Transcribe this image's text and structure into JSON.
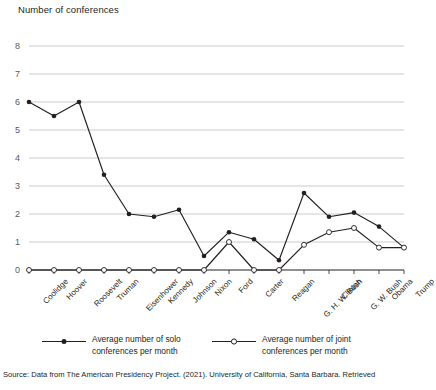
{
  "chart": {
    "axis_title": "Number of conferences",
    "source_note": "Source: Data from The American Presidency Project. (2021). University of California, Santa Barbara. Retrieved"
  },
  "legend": {
    "items": [
      {
        "name": "solo",
        "label": "Average number of solo conferences per month",
        "line1": "Average number of solo",
        "line2": "conferences per month",
        "marker": "filled",
        "color": "#231f20"
      },
      {
        "name": "joint",
        "label": "Average number of joint conferences per month",
        "line1": "Average number of joint",
        "line2": "conferences per month",
        "marker": "open",
        "color": "#231f20"
      }
    ]
  },
  "chart_data": {
    "type": "line",
    "title": "",
    "xlabel": "",
    "ylabel": "Number of conferences",
    "ylim": [
      0,
      8
    ],
    "yticks": [
      0,
      1,
      2,
      3,
      4,
      5,
      6,
      7,
      8
    ],
    "grid": true,
    "legend_position": "bottom",
    "categories": [
      "Coolidge",
      "Hoover",
      "Roosevelt",
      "Truman",
      "Eisenhower",
      "Kennedy",
      "Johnson",
      "Nixon",
      "Ford",
      "Carter",
      "Reagan",
      "G. H. W. Bush",
      "Clinton",
      "G. W. Bush",
      "Obama",
      "Trump"
    ],
    "series": [
      {
        "name": "Average number of solo conferences per month",
        "marker": "filled",
        "values": [
          6.0,
          5.5,
          6.0,
          3.4,
          2.0,
          1.9,
          2.15,
          0.5,
          1.35,
          1.1,
          0.35,
          2.75,
          1.9,
          2.05,
          1.55,
          0.8
        ]
      },
      {
        "name": "Average number of joint conferences per month",
        "marker": "open",
        "values": [
          0,
          0,
          0,
          0,
          0,
          0,
          0,
          0,
          1.0,
          0,
          0,
          0.9,
          1.35,
          1.5,
          0.8,
          0.8
        ]
      }
    ]
  },
  "colors": {
    "line": "#231f20",
    "grid": "#bcbec0",
    "axis": "#231f20",
    "marker_fill_open": "#ffffff",
    "text": "#231f20"
  }
}
